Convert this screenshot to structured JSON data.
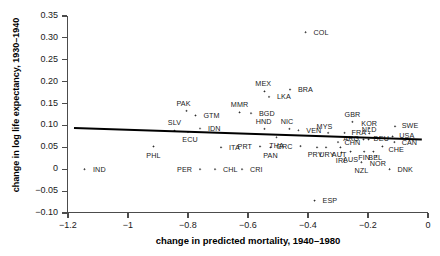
{
  "chart_data": {
    "type": "scatter",
    "title": "",
    "xlabel": "change in predicted mortality, 1940–1980",
    "ylabel": "change in log life expectancy, 1930–1940",
    "xlim": [
      -1.2,
      0.0
    ],
    "ylim": [
      -0.1,
      0.35
    ],
    "xticks": [
      -1.2,
      -1,
      -0.8,
      -0.6,
      -0.4,
      -0.2,
      0
    ],
    "xtick_labels": [
      "−1.2",
      "−1",
      "−0.8",
      "−0.6",
      "−0.4",
      "−0.2",
      "0"
    ],
    "yticks": [
      -0.1,
      -0.05,
      0,
      0.05,
      0.1,
      0.15,
      0.2,
      0.25,
      0.3,
      0.35
    ],
    "ytick_labels": [
      "−0.10",
      "−0.05",
      "0",
      "0.05",
      "0.10",
      "0.15",
      "0.20",
      "0.25",
      "0.30",
      "0.35"
    ],
    "grid": false,
    "legend": "none",
    "fit_line": {
      "x0": -1.18,
      "y0": 0.094,
      "x1": -0.02,
      "y1": 0.068
    },
    "points": [
      {
        "label": "IND",
        "x": -1.145,
        "y": 0.0,
        "lx": -1.125,
        "ly": 0.0,
        "anchor": "left"
      },
      {
        "label": "PHL",
        "x": -0.915,
        "y": 0.052,
        "lx": -0.915,
        "ly": 0.032,
        "anchor": "center"
      },
      {
        "label": "SLV",
        "x": -0.845,
        "y": 0.088,
        "lx": -0.845,
        "ly": 0.106,
        "anchor": "center"
      },
      {
        "label": "ECU",
        "x": -0.8,
        "y": 0.085,
        "lx": -0.793,
        "ly": 0.067,
        "anchor": "center"
      },
      {
        "label": "PER",
        "x": -0.76,
        "y": 0.0,
        "lx": -0.778,
        "ly": 0.0,
        "anchor": "right"
      },
      {
        "label": "IDN",
        "x": -0.76,
        "y": 0.093,
        "lx": -0.742,
        "ly": 0.093,
        "anchor": "left"
      },
      {
        "label": "CHL",
        "x": -0.71,
        "y": 0.0,
        "lx": -0.692,
        "ly": 0.0,
        "anchor": "left"
      },
      {
        "label": "PAK",
        "x": -0.805,
        "y": 0.133,
        "lx": -0.815,
        "ly": 0.15,
        "anchor": "center"
      },
      {
        "label": "GTM",
        "x": -0.775,
        "y": 0.123,
        "lx": -0.757,
        "ly": 0.123,
        "anchor": "left"
      },
      {
        "label": "ITA",
        "x": -0.69,
        "y": 0.05,
        "lx": -0.672,
        "ly": 0.05,
        "anchor": "left"
      },
      {
        "label": "CRI",
        "x": -0.62,
        "y": 0.0,
        "lx": -0.602,
        "ly": 0.0,
        "anchor": "left"
      },
      {
        "label": "MMR",
        "x": -0.628,
        "y": 0.13,
        "lx": -0.628,
        "ly": 0.148,
        "anchor": "center"
      },
      {
        "label": "BGD",
        "x": -0.59,
        "y": 0.128,
        "lx": -0.572,
        "ly": 0.128,
        "anchor": "left"
      },
      {
        "label": "MEX",
        "x": -0.545,
        "y": 0.178,
        "lx": -0.549,
        "ly": 0.196,
        "anchor": "center"
      },
      {
        "label": "LKA",
        "x": -0.53,
        "y": 0.165,
        "lx": -0.512,
        "ly": 0.165,
        "anchor": "left"
      },
      {
        "label": "HND",
        "x": -0.545,
        "y": 0.092,
        "lx": -0.548,
        "ly": 0.11,
        "anchor": "center"
      },
      {
        "label": "PRT",
        "x": -0.56,
        "y": 0.052,
        "lx": -0.578,
        "ly": 0.052,
        "anchor": "right"
      },
      {
        "label": "PAN",
        "x": -0.525,
        "y": 0.05,
        "lx": -0.525,
        "ly": 0.031,
        "anchor": "center"
      },
      {
        "label": "THA",
        "x": -0.505,
        "y": 0.073,
        "lx": -0.505,
        "ly": 0.055,
        "anchor": "center"
      },
      {
        "label": "BRA",
        "x": -0.46,
        "y": 0.182,
        "lx": -0.442,
        "ly": 0.182,
        "anchor": "left"
      },
      {
        "label": "COL",
        "x": -0.408,
        "y": 0.313,
        "lx": -0.39,
        "ly": 0.313,
        "anchor": "left"
      },
      {
        "label": "NIC",
        "x": -0.462,
        "y": 0.092,
        "lx": -0.47,
        "ly": 0.11,
        "anchor": "center"
      },
      {
        "label": "VEN",
        "x": -0.432,
        "y": 0.089,
        "lx": -0.414,
        "ly": 0.089,
        "anchor": "left"
      },
      {
        "label": "GRC",
        "x": -0.425,
        "y": 0.053,
        "lx": -0.443,
        "ly": 0.053,
        "anchor": "right"
      },
      {
        "label": "ESP",
        "x": -0.378,
        "y": -0.072,
        "lx": -0.36,
        "ly": -0.072,
        "anchor": "left"
      },
      {
        "label": "PRY",
        "x": -0.37,
        "y": 0.05,
        "lx": -0.376,
        "ly": 0.033,
        "anchor": "center"
      },
      {
        "label": "URY",
        "x": -0.34,
        "y": 0.05,
        "lx": -0.337,
        "ly": 0.033,
        "anchor": "center"
      },
      {
        "label": "MYS",
        "x": -0.333,
        "y": 0.083,
        "lx": -0.345,
        "ly": 0.097,
        "anchor": "center"
      },
      {
        "label": "CHN",
        "x": -0.3,
        "y": 0.062,
        "lx": -0.287,
        "ly": 0.062,
        "anchor": "left"
      },
      {
        "label": "AUT",
        "x": -0.292,
        "y": 0.05,
        "lx": -0.296,
        "ly": 0.034,
        "anchor": "center"
      },
      {
        "label": "IRL",
        "x": -0.288,
        "y": 0.038,
        "lx": -0.288,
        "ly": 0.021,
        "anchor": "center"
      },
      {
        "label": "FRA",
        "x": -0.278,
        "y": 0.083,
        "lx": -0.263,
        "ly": 0.083,
        "anchor": "left"
      },
      {
        "label": "AUS",
        "x": -0.258,
        "y": 0.04,
        "lx": -0.258,
        "ly": 0.023,
        "anchor": "center"
      },
      {
        "label": "GBR",
        "x": -0.252,
        "y": 0.108,
        "lx": -0.252,
        "ly": 0.126,
        "anchor": "center"
      },
      {
        "label": "ARG",
        "x": -0.215,
        "y": 0.068,
        "lx": -0.221,
        "ly": 0.071,
        "anchor": "right"
      },
      {
        "label": "DEU",
        "x": -0.198,
        "y": 0.068,
        "lx": -0.19,
        "ly": 0.071,
        "anchor": "left"
      },
      {
        "label": "NLD",
        "x": -0.196,
        "y": 0.082,
        "lx": -0.196,
        "ly": 0.09,
        "anchor": "center"
      },
      {
        "label": "KOR",
        "x": -0.196,
        "y": 0.094,
        "lx": -0.196,
        "ly": 0.104,
        "anchor": "center"
      },
      {
        "label": "FIN",
        "x": -0.213,
        "y": 0.04,
        "lx": -0.213,
        "ly": 0.026,
        "anchor": "center"
      },
      {
        "label": "BEL",
        "x": -0.182,
        "y": 0.04,
        "lx": -0.176,
        "ly": 0.026,
        "anchor": "center"
      },
      {
        "label": "NOR",
        "x": -0.172,
        "y": 0.03,
        "lx": -0.167,
        "ly": 0.013,
        "anchor": "center"
      },
      {
        "label": "NZL",
        "x": -0.222,
        "y": 0.016,
        "lx": -0.222,
        "ly": -0.002,
        "anchor": "center"
      },
      {
        "label": "CHE",
        "x": -0.152,
        "y": 0.052,
        "lx": -0.14,
        "ly": 0.046,
        "anchor": "left"
      },
      {
        "label": "USA",
        "x": -0.118,
        "y": 0.075,
        "lx": -0.104,
        "ly": 0.078,
        "anchor": "left"
      },
      {
        "label": "CAN",
        "x": -0.112,
        "y": 0.062,
        "lx": -0.096,
        "ly": 0.062,
        "anchor": "left"
      },
      {
        "label": "SWE",
        "x": -0.11,
        "y": 0.098,
        "lx": -0.096,
        "ly": 0.101,
        "anchor": "left"
      },
      {
        "label": "DNK",
        "x": -0.128,
        "y": 0.0,
        "lx": -0.11,
        "ly": 0.0,
        "anchor": "left"
      }
    ]
  }
}
